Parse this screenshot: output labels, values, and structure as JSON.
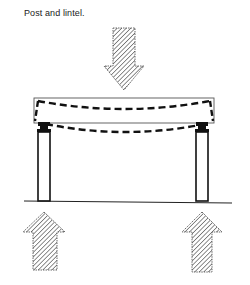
{
  "caption": "Post and lintel.",
  "diagram": {
    "type": "structural-load-diagram",
    "elements": {
      "load_arrow": {
        "direction": "down",
        "label": "applied load",
        "fill": "hatched"
      },
      "lintel": {
        "label": "lintel (beam)",
        "deflection": "sagging, shown dashed"
      },
      "posts": [
        {
          "label": "left post"
        },
        {
          "label": "right post"
        }
      ],
      "ground": {
        "label": "ground line"
      },
      "reaction_arrows": [
        {
          "direction": "up",
          "label": "left reaction"
        },
        {
          "direction": "up",
          "label": "right reaction"
        }
      ]
    },
    "colors": {
      "ink": "#111111",
      "background": "#ffffff",
      "hatch": "#333333"
    }
  }
}
